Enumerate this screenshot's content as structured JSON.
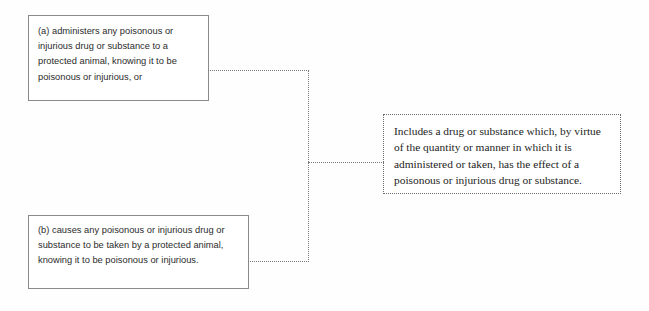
{
  "diagram": {
    "background_color": "#fefefe",
    "box_border_color": "#8a8a8a",
    "note_border_color": "#6d6d6d",
    "connector_color": "#7a7a7a",
    "boxes": [
      {
        "id": "box-a",
        "label": "provision-a",
        "style": "solid",
        "text": "(a) administers any poisonous or injurious drug or substance to a protected animal, knowing it to be poisonous or injurious, or"
      },
      {
        "id": "box-b",
        "label": "provision-b",
        "style": "solid",
        "text": "(b) causes any poisonous or injurious drug or substance to be taken by a protected animal, knowing it to be poisonous or injurious."
      },
      {
        "id": "box-note",
        "label": "definition-note",
        "style": "dotted",
        "text": "Includes a drug or substance which, by virtue of the quantity or manner in which it is administered or taken, has the effect of a poisonous or injurious drug or substance."
      }
    ],
    "connectors": [
      {
        "id": "conn-a-h",
        "from": "provision-a",
        "to": "spine",
        "orientation": "horizontal"
      },
      {
        "id": "conn-b-h",
        "from": "provision-b",
        "to": "spine",
        "orientation": "horizontal"
      },
      {
        "id": "conn-spine",
        "from": "provision-a",
        "to": "provision-b",
        "orientation": "vertical"
      },
      {
        "id": "conn-out-h",
        "from": "spine",
        "to": "definition-note",
        "orientation": "horizontal"
      }
    ]
  }
}
